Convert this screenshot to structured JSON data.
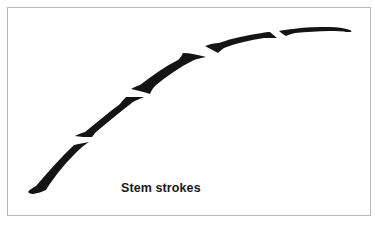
{
  "figure": {
    "caption": "Stem strokes",
    "stroke_color": "#141414",
    "border_color": "#b8b8b8",
    "background_color": "#ffffff",
    "stroke_count": 6
  }
}
